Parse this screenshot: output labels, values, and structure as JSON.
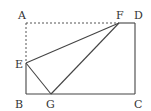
{
  "diagram": {
    "points": {
      "A": {
        "label": "A",
        "x": 26,
        "y": 23
      },
      "B": {
        "label": "B",
        "x": 26,
        "y": 94
      },
      "C": {
        "label": "C",
        "x": 135,
        "y": 94
      },
      "D": {
        "label": "D",
        "x": 135,
        "y": 23
      },
      "E": {
        "label": "E",
        "x": 26,
        "y": 63
      },
      "F": {
        "label": "F",
        "x": 119,
        "y": 23
      },
      "G": {
        "label": "G",
        "x": 51,
        "y": 94
      }
    },
    "solid_segments": [
      "F-D",
      "D-C",
      "C-B",
      "B-E",
      "E-F",
      "E-G",
      "F-G"
    ],
    "dashed_segments": [
      "A-F",
      "A-E"
    ],
    "stroke_color": "#444444"
  }
}
